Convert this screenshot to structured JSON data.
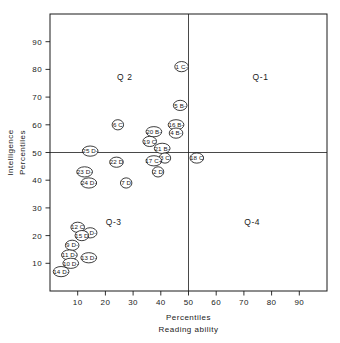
{
  "chart_data": {
    "type": "scatter",
    "title": "",
    "xlabel": "Reading ability",
    "xlabel2": "Percentiles",
    "ylabel": "Intelligence",
    "ylabel2": "Percentiles",
    "xlim": [
      0,
      100
    ],
    "ylim": [
      0,
      100
    ],
    "grid": false,
    "xticks": [
      10,
      20,
      30,
      40,
      50,
      60,
      70,
      80,
      90
    ],
    "yticks": [
      10,
      20,
      30,
      40,
      50,
      60,
      70,
      80,
      90
    ],
    "xtick_labels": [
      "10",
      "20",
      "30",
      "40",
      "50",
      "60",
      "70",
      "80",
      "90"
    ],
    "ytick_labels": [
      "10",
      "20",
      "30",
      "40",
      "50",
      "60",
      "70",
      "80",
      "90"
    ],
    "reference_lines": [
      {
        "orientation": "vertical",
        "value": 50
      },
      {
        "orientation": "horizontal",
        "value": 50
      }
    ],
    "quadrant_labels": [
      {
        "text": "Q 2",
        "x": 27,
        "y": 76
      },
      {
        "text": "Q-1",
        "x": 76,
        "y": 76
      },
      {
        "text": "Q-3",
        "x": 23,
        "y": 24
      },
      {
        "text": "Q-4",
        "x": 73,
        "y": 24
      }
    ],
    "points": [
      {
        "label": "1 C-",
        "x": 47.5,
        "y": 81
      },
      {
        "label": "5 B-",
        "x": 47.0,
        "y": 67
      },
      {
        "label": "6 C",
        "x": 24.5,
        "y": 60
      },
      {
        "label": "16 B-",
        "x": 45.5,
        "y": 60
      },
      {
        "label": "20 B-",
        "x": 37.5,
        "y": 57.5
      },
      {
        "label": "4 B-",
        "x": 45.5,
        "y": 57
      },
      {
        "label": "19 C",
        "x": 36.0,
        "y": 54
      },
      {
        "label": "21 B-",
        "x": 40.5,
        "y": 51.5
      },
      {
        "label": "25 D-",
        "x": 14.5,
        "y": 50.5
      },
      {
        "label": "18 C",
        "x": 53.0,
        "y": 48
      },
      {
        "label": "3 C",
        "x": 41.5,
        "y": 48
      },
      {
        "label": "17 C+",
        "x": 37.5,
        "y": 47
      },
      {
        "label": "22 D",
        "x": 24.0,
        "y": 46.5
      },
      {
        "label": "2 D",
        "x": 39.0,
        "y": 43
      },
      {
        "label": "23 D-",
        "x": 12.5,
        "y": 43
      },
      {
        "label": "24 D-",
        "x": 14.0,
        "y": 39
      },
      {
        "label": "7 D",
        "x": 27.5,
        "y": 39
      },
      {
        "label": "12 C",
        "x": 10.0,
        "y": 23
      },
      {
        "label": "8 D-",
        "x": 14.5,
        "y": 21
      },
      {
        "label": "15 D",
        "x": 11.5,
        "y": 20
      },
      {
        "label": "9 D-",
        "x": 8.0,
        "y": 16.5
      },
      {
        "label": "11 D-",
        "x": 7.0,
        "y": 13
      },
      {
        "label": "13 D-",
        "x": 14.0,
        "y": 12
      },
      {
        "label": "10 D-",
        "x": 7.5,
        "y": 10
      },
      {
        "label": "14 D-",
        "x": 4.0,
        "y": 7
      }
    ]
  }
}
